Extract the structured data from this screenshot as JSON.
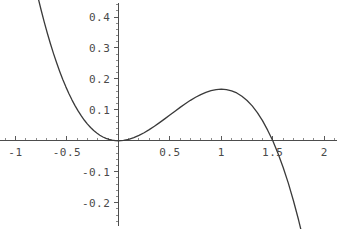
{
  "chart_data": {
    "type": "line",
    "title": "",
    "subtitle": "",
    "xlabel": "",
    "ylabel": "",
    "function": "y = x^2/2 - x^3/3",
    "xlim": [
      -1.15,
      2.25
    ],
    "ylim": [
      -0.285,
      0.455
    ],
    "grid": false,
    "legend": null,
    "axis_style": "centered-cross",
    "x_ticks": [
      {
        "value": -1,
        "label": "-1"
      },
      {
        "value": -0.5,
        "label": "-0.5"
      },
      {
        "value": 0.5,
        "label": "0.5"
      },
      {
        "value": 1,
        "label": "1"
      },
      {
        "value": 1.5,
        "label": "1.5"
      },
      {
        "value": 2,
        "label": "2"
      }
    ],
    "y_ticks": [
      {
        "value": 0.4,
        "label": "0.4"
      },
      {
        "value": 0.3,
        "label": "0.3"
      },
      {
        "value": 0.2,
        "label": "0.2"
      },
      {
        "value": 0.1,
        "label": "0.1"
      },
      {
        "value": -0.1,
        "label": "-0.1"
      },
      {
        "value": -0.2,
        "label": "-0.2"
      }
    ],
    "x_minor_step": 0.1,
    "y_minor_step": 0.02,
    "series": [
      {
        "name": "curve",
        "color": "#3a3a3a",
        "x_start": -0.81,
        "x_end": 1.95,
        "points": [
          [
            -0.81,
            0.5051
          ],
          [
            -0.78,
            0.4623
          ],
          [
            -0.75,
            0.4219
          ],
          [
            -0.72,
            0.3836
          ],
          [
            -0.69,
            0.3476
          ],
          [
            -0.66,
            0.3136
          ],
          [
            -0.63,
            0.2817
          ],
          [
            -0.6,
            0.252
          ],
          [
            -0.57,
            0.2242
          ],
          [
            -0.54,
            0.1983
          ],
          [
            -0.51,
            0.1743
          ],
          [
            -0.48,
            0.1521
          ],
          [
            -0.45,
            0.1316
          ],
          [
            -0.42,
            0.1129
          ],
          [
            -0.39,
            0.0959
          ],
          [
            -0.36,
            0.0803
          ],
          [
            -0.33,
            0.0664
          ],
          [
            -0.3,
            0.054
          ],
          [
            -0.27,
            0.043
          ],
          [
            -0.24,
            0.0334
          ],
          [
            -0.21,
            0.0252
          ],
          [
            -0.18,
            0.0181
          ],
          [
            -0.15,
            0.0124
          ],
          [
            -0.12,
            0.0078
          ],
          [
            -0.09,
            0.0043
          ],
          [
            -0.06,
            0.0019
          ],
          [
            -0.03,
            0.0005
          ],
          [
            0.0,
            0.0
          ],
          [
            0.05,
            0.0012
          ],
          [
            0.1,
            0.0047
          ],
          [
            0.15,
            0.0101
          ],
          [
            0.2,
            0.0173
          ],
          [
            0.25,
            0.026
          ],
          [
            0.3,
            0.036
          ],
          [
            0.35,
            0.047
          ],
          [
            0.4,
            0.0587
          ],
          [
            0.45,
            0.0709
          ],
          [
            0.5,
            0.0833
          ],
          [
            0.55,
            0.0958
          ],
          [
            0.6,
            0.108
          ],
          [
            0.65,
            0.1198
          ],
          [
            0.7,
            0.1308
          ],
          [
            0.75,
            0.1406
          ],
          [
            0.8,
            0.1493
          ],
          [
            0.85,
            0.1565
          ],
          [
            0.9,
            0.162
          ],
          [
            0.95,
            0.1657
          ],
          [
            1.0,
            0.1667
          ],
          [
            1.05,
            0.1653
          ],
          [
            1.1,
            0.1613
          ],
          [
            1.15,
            0.1546
          ],
          [
            1.2,
            0.144
          ],
          [
            1.25,
            0.1302
          ],
          [
            1.3,
            0.1129
          ],
          [
            1.35,
            0.0911
          ],
          [
            1.4,
            0.0653
          ],
          [
            1.45,
            0.0344
          ],
          [
            1.5,
            0.0
          ],
          [
            1.55,
            -0.0403
          ],
          [
            1.6,
            -0.0853
          ],
          [
            1.65,
            -0.1361
          ],
          [
            1.7,
            -0.1928
          ],
          [
            1.75,
            -0.2552
          ],
          [
            1.8,
            -0.324
          ],
          [
            1.85,
            -0.3988
          ],
          [
            1.9,
            -0.4802
          ],
          [
            1.95,
            -0.5679
          ]
        ]
      }
    ],
    "annotations": {
      "roots": [
        0,
        1.5
      ],
      "local_minimum": {
        "x": 0,
        "y": 0
      },
      "local_maximum": {
        "x": 1,
        "y": 0.1667
      }
    }
  },
  "colors": {
    "curve": "#3a3a3a",
    "axis": "#4d4d4d",
    "tick_major": "#5a5a5a",
    "tick_minor": "#8c8c8c",
    "label_text": "#4a4a4a",
    "background": "#ffffff"
  }
}
